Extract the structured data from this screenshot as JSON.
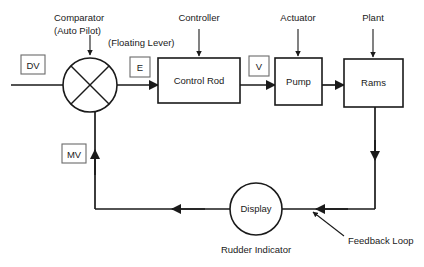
{
  "diagram": {
    "background_color": "#ffffff",
    "line_color": "#1a1a1a",
    "box_fill": "#ffffff",
    "annotations": {
      "comparator_line1": "Comparator",
      "comparator_line2": "(Auto Pilot)",
      "floating_lever": "(Floating Lever)",
      "controller": "Controller",
      "actuator": "Actuator",
      "plant": "Plant",
      "rudder_indicator": "Rudder Indicator",
      "feedback_loop": "Feedback Loop"
    },
    "signals": {
      "dv": "DV",
      "e": "E",
      "v": "V",
      "mv": "MV"
    },
    "blocks": {
      "control_rod": "Control Rod",
      "pump": "Pump",
      "rams": "Rams",
      "display": "Display"
    }
  }
}
